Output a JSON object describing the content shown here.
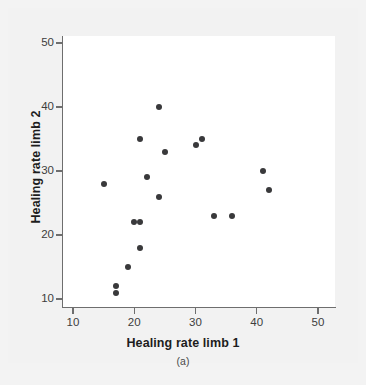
{
  "figure": {
    "caption": "(a)",
    "background_color": "#f2f2f2",
    "plot_background_color": "#ffffff",
    "axis_color": "#6e6e6e",
    "point_color": "#39393b"
  },
  "chart_data": {
    "type": "scatter",
    "title": "",
    "xlabel": "Healing rate limb 1",
    "ylabel": "Healing rate limb 2",
    "xlim": [
      7,
      52
    ],
    "ylim": [
      7,
      52
    ],
    "xticks": [
      10,
      20,
      30,
      40,
      50
    ],
    "yticks": [
      10,
      20,
      30,
      40,
      50
    ],
    "xtick_labels": [
      "10",
      "20",
      "30",
      "40",
      "50"
    ],
    "ytick_labels": [
      "10",
      "20",
      "30",
      "40",
      "50"
    ],
    "grid": false,
    "legend": null,
    "marker": "filled-circle",
    "points": [
      {
        "x": 15,
        "y": 28
      },
      {
        "x": 17,
        "y": 12
      },
      {
        "x": 17,
        "y": 11
      },
      {
        "x": 19,
        "y": 15
      },
      {
        "x": 20,
        "y": 22
      },
      {
        "x": 21,
        "y": 35
      },
      {
        "x": 21,
        "y": 22
      },
      {
        "x": 21,
        "y": 18
      },
      {
        "x": 22,
        "y": 29
      },
      {
        "x": 24,
        "y": 40
      },
      {
        "x": 24,
        "y": 26
      },
      {
        "x": 25,
        "y": 33
      },
      {
        "x": 30,
        "y": 34
      },
      {
        "x": 31,
        "y": 35
      },
      {
        "x": 33,
        "y": 23
      },
      {
        "x": 36,
        "y": 23
      },
      {
        "x": 41,
        "y": 30
      },
      {
        "x": 42,
        "y": 27
      }
    ]
  }
}
